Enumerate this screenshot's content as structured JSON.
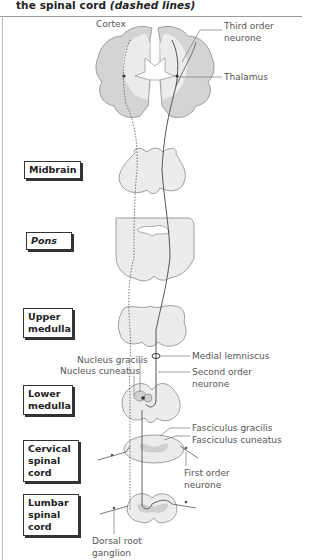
{
  "caption": {
    "line": "the spinal cord ",
    "emphasis": "(dashed lines)"
  },
  "level_labels": [
    {
      "id": "midbrain",
      "text": "Midbrain"
    },
    {
      "id": "pons",
      "text": "Pons"
    },
    {
      "id": "upper-medulla",
      "text": "Upper medulla"
    },
    {
      "id": "lower-medulla",
      "text": "Lower medulla"
    },
    {
      "id": "cervical-spinal-cord",
      "text": "Cervical spinal cord"
    },
    {
      "id": "lumbar-spinal-cord",
      "text": "Lumbar spinal cord"
    }
  ],
  "annotations": {
    "cortex": "Cortex",
    "third_order_neurone": "Third order neurone",
    "thalamus": "Thalamus",
    "nucleus_gracilis": "Nucleus gracilis",
    "nucleus_cuneatus": "Nucleus cuneatus",
    "medial_lemniscus": "Medial lemniscus",
    "second_order_neurone": "Second order neurone",
    "fasciculus_gracilis": "Fasciculus gracilis",
    "fasciculus_cuneatus": "Fasciculus cuneatus",
    "first_order_neurone": "First order neurone",
    "dorsal_root_ganglion": "Dorsal root ganglion"
  },
  "colors": {
    "tissue_fill": "#e6e6e6",
    "grey_matter": "#cfcfcf",
    "outline": "#888888",
    "pathway": "#555555"
  }
}
